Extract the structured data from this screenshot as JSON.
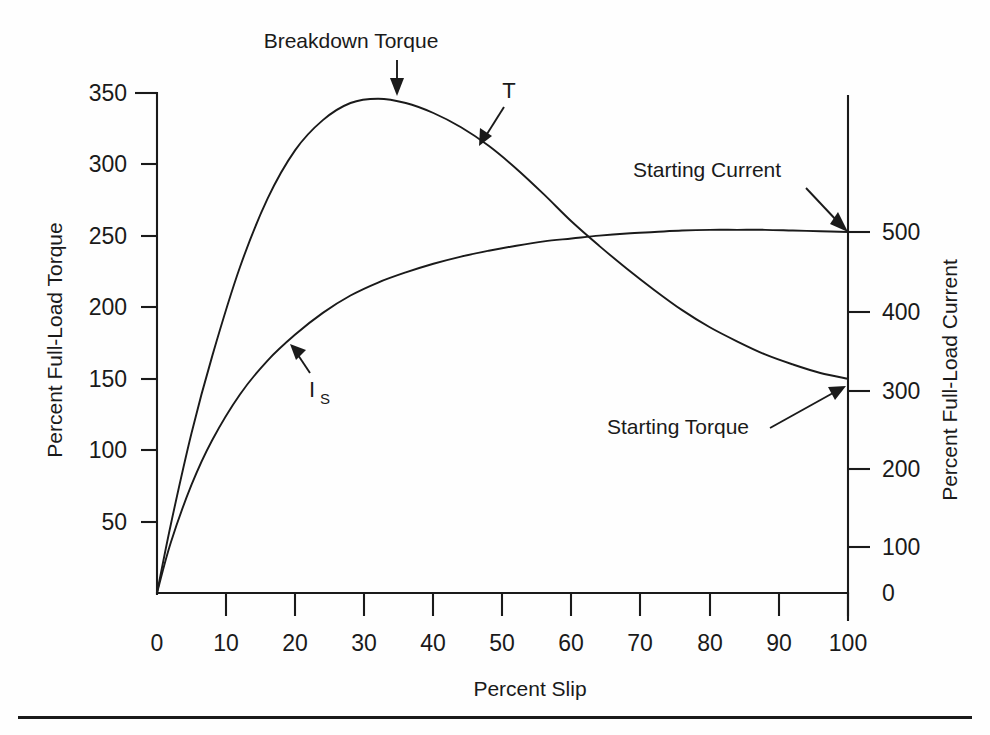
{
  "figure": {
    "background_color": "#fefefe",
    "ink_color": "#1a1a1a"
  },
  "chart_data": {
    "type": "line",
    "title": "",
    "xlabel": "Percent Slip",
    "ylabel": "Percent Full-Load Torque",
    "y2label": "Percent Full-Load Current",
    "xlim": [
      0,
      100
    ],
    "ylim": [
      0,
      360
    ],
    "y2lim": [
      0,
      620
    ],
    "grid": false,
    "legend": "none",
    "xticks": [
      0,
      10,
      20,
      30,
      40,
      50,
      60,
      70,
      80,
      90,
      100
    ],
    "xtick_labels": [
      "0",
      "10",
      "20",
      "30",
      "40",
      "50",
      "60",
      "70",
      "80",
      "90",
      "100"
    ],
    "yticks": [
      50,
      100,
      150,
      200,
      250,
      300,
      350
    ],
    "ytick_labels": [
      "50",
      "100",
      "150",
      "200",
      "250",
      "300",
      "350"
    ],
    "y2ticks": [
      0,
      100,
      200,
      300,
      400,
      500
    ],
    "y2tick_labels": [
      "0",
      "100",
      "200",
      "300",
      "400",
      "500"
    ],
    "series": [
      {
        "name": "T",
        "axis": "left",
        "units": "Percent Full-Load Torque",
        "x": [
          0,
          2,
          5,
          8,
          12,
          16,
          20,
          24,
          28,
          32,
          36,
          40,
          44,
          48,
          52,
          56,
          60,
          64,
          68,
          72,
          76,
          80,
          84,
          88,
          92,
          96,
          100
        ],
        "values": [
          0,
          48,
          112,
          166,
          228,
          276,
          310,
          331,
          343,
          346,
          343,
          336,
          326,
          313,
          297,
          279,
          260,
          243,
          227,
          212,
          198,
          186,
          176,
          167,
          160,
          154,
          150
        ]
      },
      {
        "name": "I_S",
        "axis": "right",
        "units": "Percent Full-Load Current",
        "x": [
          0,
          2,
          5,
          8,
          12,
          16,
          20,
          24,
          28,
          32,
          36,
          40,
          44,
          48,
          52,
          56,
          60,
          64,
          68,
          72,
          76,
          80,
          84,
          88,
          92,
          96,
          100
        ],
        "values": [
          0,
          70,
          150,
          212,
          275,
          322,
          358,
          388,
          412,
          430,
          444,
          456,
          466,
          474,
          481,
          487,
          491,
          495,
          498,
          500,
          502,
          503,
          503,
          503,
          502,
          501,
          500
        ]
      }
    ],
    "annotations": [
      {
        "name": "breakdown-torque",
        "text": "Breakdown Torque",
        "points_to_series": "T",
        "points_to_x": 32,
        "points_to_value": 346
      },
      {
        "name": "starting-current",
        "text": "Starting Current",
        "points_to_series": "I_S",
        "points_to_x": 100,
        "points_to_value": 500
      },
      {
        "name": "starting-torque",
        "text": "Starting Torque",
        "points_to_series": "T",
        "points_to_x": 100,
        "points_to_value": 150
      },
      {
        "name": "torque-curve-label",
        "text": "T",
        "points_to_series": "T",
        "points_to_x": 48,
        "points_to_value": 313
      },
      {
        "name": "current-curve-label",
        "text": "I",
        "subscript": "S",
        "points_to_series": "I_S",
        "points_to_x": 20,
        "points_to_value": 358
      }
    ]
  },
  "labels": {
    "y_axis_title": "Percent Full-Load Torque",
    "y2_axis_title": "Percent Full-Load Current",
    "x_axis_title": "Percent Slip",
    "breakdown_torque": "Breakdown Torque",
    "starting_current": "Starting Current",
    "starting_torque": "Starting Torque",
    "torque_symbol": "T",
    "current_symbol": "I",
    "current_subscript": "S"
  },
  "ticks": {
    "x": [
      "0",
      "10",
      "20",
      "30",
      "40",
      "50",
      "60",
      "70",
      "80",
      "90",
      "100"
    ],
    "y_left": [
      "350",
      "300",
      "250",
      "200",
      "150",
      "100",
      "50"
    ],
    "y_right": [
      "500",
      "400",
      "300",
      "200",
      "100",
      "0"
    ]
  }
}
